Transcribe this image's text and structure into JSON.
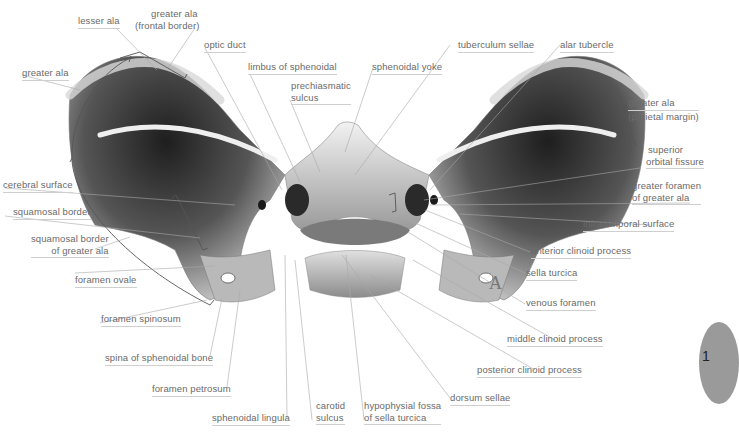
{
  "figure": {
    "view_letter": "A",
    "page_tab": "1"
  },
  "labels": {
    "lesser_ala": "lesser ala",
    "greater_ala_frontal_1": "greater ala",
    "greater_ala_frontal_2": "(frontal border)",
    "optic_duct": "optic duct",
    "greater_ala_left": "greater ala",
    "limbus": "limbus of sphenoidal",
    "prechiasmatic_1": "prechiasmatic",
    "prechiasmatic_2": "sulcus",
    "sphenoidal_yoke": "sphenoidal yoke",
    "tuberculum_sellae": "tuberculum sellae",
    "alar_tubercle": "alar tubercle",
    "greater_ala_parietal_1": "greater ala",
    "greater_ala_parietal_2": "(parietal margin)",
    "superior_orbital_1": "superior",
    "superior_orbital_2": "orbital fissure",
    "greater_foramen_1": "greater foramen",
    "greater_foramen_2": "of greater ala",
    "cerebral_surface": "cerebral surface",
    "infratemporal_surface": "infratemporal surface",
    "squamosal_border": "squamosal border",
    "anterior_clinoid": "anterior clinoid process",
    "squamosal_greater_1": "squamosal border",
    "squamosal_greater_2": "of greater ala",
    "sella_turcica": "sella turcica",
    "foramen_ovale": "foramen ovale",
    "venous_foramen": "venous foramen",
    "foramen_spinosum": "foramen spinosum",
    "middle_clinoid": "middle clinoid process",
    "spina_sphenoidal": "spina of sphenoidal bone",
    "posterior_clinoid": "posterior clinoid process",
    "foramen_petrosum": "foramen petrosum",
    "dorsum_sellae": "dorsum sellae",
    "sphenoidal_lingula": "sphenoidal lingula",
    "carotid_1": "carotid",
    "carotid_2": "sulcus",
    "hypophysial_1": "hypophysial fossa",
    "hypophysial_2": "of sella turcica"
  },
  "colors": {
    "label_text": "#6a6a6a",
    "leader_line": "#a8a8a8",
    "bracket": "#555555",
    "bone_light": "#e8e8e8",
    "bone_dark": "#3a3a3a",
    "tab": "#9a9a9a"
  }
}
